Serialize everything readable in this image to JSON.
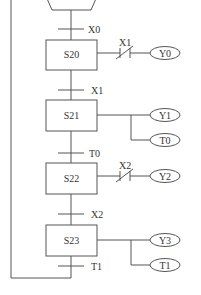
{
  "diagram": {
    "type": "sequential function chart",
    "initial_step": {
      "shape": "hexagon",
      "label": ""
    },
    "steps": [
      {
        "id": "S20",
        "label": "S20",
        "actions": [
          {
            "label": "Y0",
            "condition_contact": "X1",
            "contact_type": "normally-closed"
          }
        ]
      },
      {
        "id": "S21",
        "label": "S21",
        "actions": [
          {
            "label": "Y1"
          },
          {
            "label": "T0"
          }
        ]
      },
      {
        "id": "S22",
        "label": "S22",
        "actions": [
          {
            "label": "Y2",
            "condition_contact": "X2",
            "contact_type": "normally-closed"
          }
        ]
      },
      {
        "id": "S23",
        "label": "S23",
        "actions": [
          {
            "label": "Y3"
          },
          {
            "label": "T1"
          }
        ]
      }
    ],
    "transitions": [
      {
        "label": "X0"
      },
      {
        "label": "X1"
      },
      {
        "label": "T0"
      },
      {
        "label": "X2"
      },
      {
        "label": "T1"
      }
    ]
  },
  "colors": {
    "line": "#555555",
    "text": "#333333",
    "background": "#ffffff"
  }
}
